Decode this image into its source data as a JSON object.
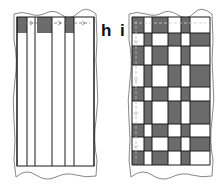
{
  "figure": {
    "panels": [
      {
        "label": "h",
        "description": "warp threads only",
        "frame": {
          "x": 17,
          "y": 17,
          "w": 77,
          "h": 149
        },
        "column_edges": [
          17,
          27,
          35,
          52,
          65,
          74,
          94
        ],
        "gray_top_blocks": [
          {
            "x": 17,
            "w": 10
          },
          {
            "x": 37,
            "w": 15
          },
          {
            "x": 65,
            "w": 9
          }
        ],
        "top_block_height": 16
      },
      {
        "label": "i",
        "description": "woven grid",
        "frame": {
          "x": 132,
          "y": 17,
          "w": 78,
          "h": 148
        },
        "column_edges": [
          132,
          144,
          152,
          168,
          181,
          190,
          210
        ],
        "row_edges": [
          17,
          33,
          46,
          65,
          87,
          101,
          124,
          137,
          151,
          165
        ],
        "warp_gray_columns": [
          0,
          2,
          4
        ],
        "inverted_rows": [
          1,
          3,
          5,
          7
        ]
      }
    ],
    "colors": {
      "gray_fill": "#6b6b6b",
      "line": "#1a1a1a",
      "outline": "#888888",
      "dashed": "#777777"
    }
  }
}
